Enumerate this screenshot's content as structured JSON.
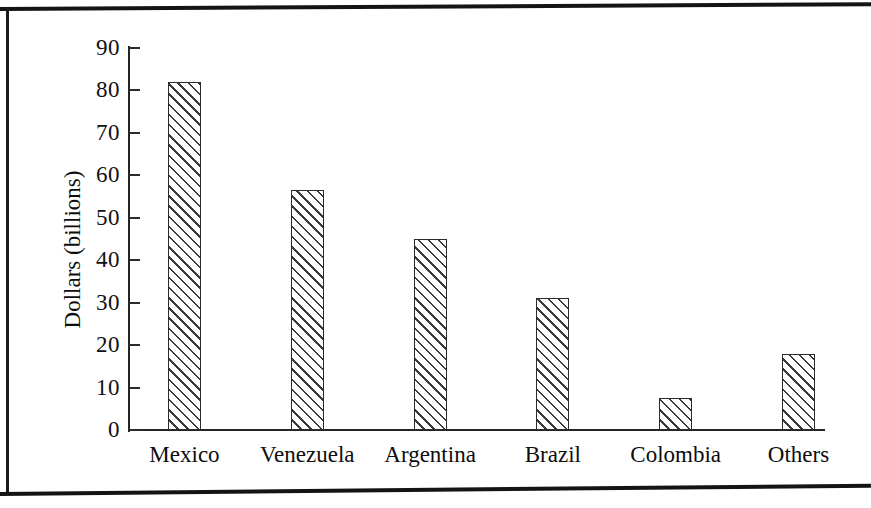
{
  "page": {
    "background": "#ffffff",
    "ink_color": "#141414",
    "borders": [
      "page-rule-top",
      "page-rule-left",
      "page-rule-bottom"
    ]
  },
  "chart_data": {
    "type": "bar",
    "title": "",
    "subtitle": "",
    "xlabel": "",
    "ylabel": "Dollars (billions)",
    "categories": [
      "Mexico",
      "Venezuela",
      "Argentina",
      "Brazil",
      "Colombia",
      "Others"
    ],
    "values": [
      82,
      56.5,
      45,
      31,
      7.5,
      18
    ],
    "ylim": [
      0,
      90
    ],
    "ytick_values": [
      0,
      10,
      20,
      30,
      40,
      50,
      60,
      70,
      80,
      90
    ],
    "ytick_labels": [
      "0",
      "10",
      "20",
      "30",
      "40",
      "50",
      "60",
      "70",
      "80",
      "90"
    ],
    "grid": false,
    "legend": null,
    "legend_position": "none",
    "bar_fill": "diagonal-hatch",
    "bar_edge_color": "#2b2b2b",
    "bar_hatch_color": "#3a3a3a",
    "annotations": []
  },
  "axes": {
    "y_title": "Dollars (billions)",
    "tick_direction": "inward"
  }
}
